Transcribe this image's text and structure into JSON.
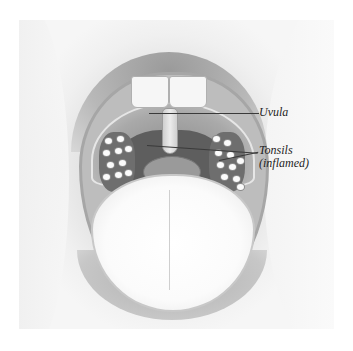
{
  "illustration": {
    "subject": "open mouth with inflamed tonsils",
    "labels": {
      "uvula": "Uvula",
      "tonsils_line1": "Tonsils",
      "tonsils_line2": "(inflamed)"
    }
  },
  "colors": {
    "background": "#ffffff",
    "label_text": "#1e1e1e",
    "leader_line": "#3a3a3a"
  }
}
